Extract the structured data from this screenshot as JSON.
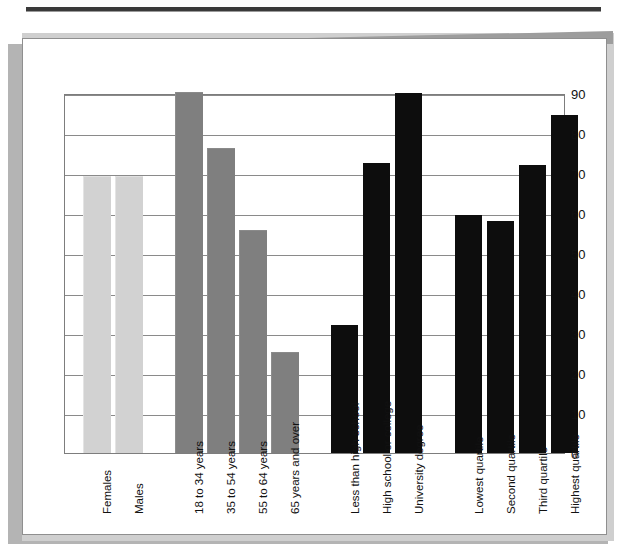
{
  "page": {
    "kind": "printed-report-page",
    "top_rule": "horizontal-rule"
  },
  "chart_data": {
    "type": "bar",
    "title": "",
    "subtitle": "",
    "xlabel": "",
    "ylabel": "",
    "ylim": [
      0,
      90
    ],
    "ytick_step": 10,
    "yticks": [
      "90",
      "80",
      "70",
      "60",
      "50",
      "40",
      "30",
      "20",
      "10",
      "0"
    ],
    "grid": true,
    "legend": "none",
    "legend_position": "none",
    "groups": [
      {
        "name": "Sex",
        "color": "#d2d2d2",
        "shade": "light",
        "categories": [
          "Females",
          "Males"
        ],
        "values": [
          69,
          69
        ]
      },
      {
        "name": "Age group",
        "color": "#7f7f7f",
        "shade": "medium",
        "categories": [
          "18 to 34 years",
          "35 to 54 years",
          "55 to 64 years",
          "65 years and over"
        ],
        "values": [
          90,
          76,
          55.5,
          25
        ]
      },
      {
        "name": "Education",
        "color": "#0d0d0d",
        "shade": "dark",
        "categories": [
          "Less than high school",
          "High school or college",
          "University degree"
        ],
        "values": [
          32,
          72.5,
          90
        ]
      },
      {
        "name": "Income quartile",
        "color": "#0d0d0d",
        "shade": "dark",
        "categories": [
          "Lowest quartile",
          "Second quartile",
          "Third quartile",
          "Highest quartile"
        ],
        "values": [
          59.5,
          58,
          72,
          84.5
        ]
      }
    ],
    "categories": [
      "Females",
      "Males",
      "18 to 34 years",
      "35 to 54 years",
      "55 to 64 years",
      "65 years and over",
      "Less than high school",
      "High school or college",
      "University degree",
      "Lowest quartile",
      "Second quartile",
      "Third quartile",
      "Highest quartile"
    ],
    "values": [
      69,
      69,
      90,
      76,
      55.5,
      25,
      32,
      72.5,
      90,
      59.5,
      58,
      72,
      84.5
    ]
  },
  "colors": {
    "light_bar": "#d2d2d2",
    "mid_bar": "#7f7f7f",
    "dark_bar": "#0d0d0d",
    "gridline": "#8a8a8a",
    "page_background": "#ffffff",
    "shadow": "#b4b4b4",
    "rule": "#3a3a3a"
  }
}
